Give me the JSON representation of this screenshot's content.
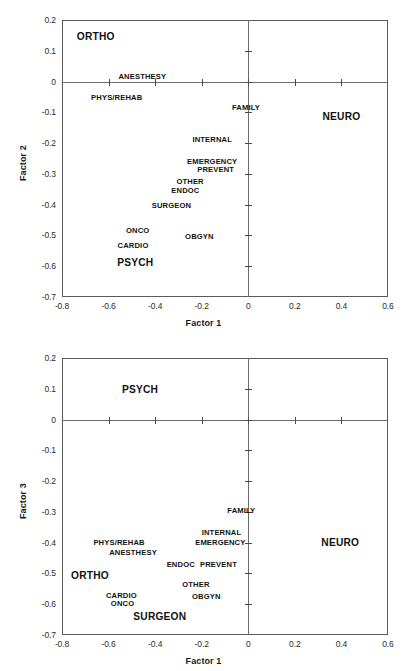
{
  "chart_data": [
    {
      "type": "scatter",
      "title": "",
      "xlabel": "Factor 1",
      "ylabel": "Factor 2",
      "xlim": [
        -0.8,
        0.6
      ],
      "ylim": [
        -0.7,
        0.2
      ],
      "xticks": [
        -0.8,
        -0.6,
        -0.4,
        -0.2,
        0,
        0.2,
        0.4,
        0.6
      ],
      "xticklabels": [
        "-0.8",
        "-0.6",
        "-0.4",
        "-0.2",
        "0",
        "0.2",
        "0.4",
        "0.6"
      ],
      "yticks": [
        0.2,
        0.1,
        0,
        -0.1,
        -0.2,
        -0.3,
        -0.4,
        -0.5,
        -0.6,
        -0.7
      ],
      "yticklabels": [
        "0.2",
        "0.1",
        "0",
        "-0.1",
        "-0.2",
        "-0.3",
        "-0.4",
        "-0.5",
        "-0.6",
        "-0.7"
      ],
      "grid": false,
      "legend": "none",
      "zero_lines": true,
      "points": [
        {
          "label": "ORTHO",
          "x": -0.655,
          "y": 0.148,
          "emphasis": "large"
        },
        {
          "label": "ANESTHESY",
          "x": -0.455,
          "y": 0.018,
          "emphasis": "normal"
        },
        {
          "label": "PHYS/REHAB",
          "x": -0.565,
          "y": -0.05,
          "emphasis": "normal"
        },
        {
          "label": "FAMILY",
          "x": -0.01,
          "y": -0.082,
          "emphasis": "normal"
        },
        {
          "label": "NEURO",
          "x": 0.4,
          "y": -0.112,
          "emphasis": "large"
        },
        {
          "label": "INTERNAL",
          "x": -0.155,
          "y": -0.188,
          "emphasis": "normal"
        },
        {
          "label": "EMERGENCY",
          "x": -0.155,
          "y": -0.258,
          "emphasis": "normal"
        },
        {
          "label": "PREVENT",
          "x": -0.14,
          "y": -0.285,
          "emphasis": "normal"
        },
        {
          "label": "OTHER",
          "x": -0.25,
          "y": -0.322,
          "emphasis": "normal"
        },
        {
          "label": "ENDOC",
          "x": -0.27,
          "y": -0.352,
          "emphasis": "normal"
        },
        {
          "label": "SURGEON",
          "x": -0.33,
          "y": -0.4,
          "emphasis": "normal"
        },
        {
          "label": "ONCO",
          "x": -0.475,
          "y": -0.482,
          "emphasis": "normal"
        },
        {
          "label": "OBGYN",
          "x": -0.21,
          "y": -0.503,
          "emphasis": "normal"
        },
        {
          "label": "CARDIO",
          "x": -0.495,
          "y": -0.53,
          "emphasis": "normal"
        },
        {
          "label": "PSYCH",
          "x": -0.485,
          "y": -0.585,
          "emphasis": "large"
        }
      ]
    },
    {
      "type": "scatter",
      "title": "",
      "xlabel": "Factor 1",
      "ylabel": "Factor 3",
      "xlim": [
        -0.8,
        0.6
      ],
      "ylim": [
        -0.7,
        0.2
      ],
      "xticks": [
        -0.8,
        -0.6,
        -0.4,
        -0.2,
        0,
        0.2,
        0.4,
        0.6
      ],
      "xticklabels": [
        "-0.8",
        "-0.6",
        "-0.4",
        "-0.2",
        "0",
        "0.2",
        "0.4",
        "0.6"
      ],
      "yticks": [
        0.2,
        0.1,
        0,
        -0.1,
        -0.2,
        -0.3,
        -0.4,
        -0.5,
        -0.6,
        -0.7
      ],
      "yticklabels": [
        "0.2",
        "0.1",
        "0",
        "-0.1",
        "-0.2",
        "-0.3",
        "-0.4",
        "-0.5",
        "-0.6",
        "-0.7"
      ],
      "grid": false,
      "legend": "none",
      "zero_lines": true,
      "points": [
        {
          "label": "PSYCH",
          "x": -0.465,
          "y": 0.098,
          "emphasis": "large"
        },
        {
          "label": "FAMILY",
          "x": -0.03,
          "y": -0.295,
          "emphasis": "normal"
        },
        {
          "label": "NEURO",
          "x": 0.395,
          "y": -0.398,
          "emphasis": "large"
        },
        {
          "label": "INTERNAL",
          "x": -0.115,
          "y": -0.365,
          "emphasis": "normal"
        },
        {
          "label": "EMERGENCY",
          "x": -0.12,
          "y": -0.398,
          "emphasis": "normal"
        },
        {
          "label": "PHYS/REHAB",
          "x": -0.555,
          "y": -0.398,
          "emphasis": "normal"
        },
        {
          "label": "ANESTHESY",
          "x": -0.495,
          "y": -0.43,
          "emphasis": "normal"
        },
        {
          "label": "ENDOC",
          "x": -0.29,
          "y": -0.468,
          "emphasis": "normal"
        },
        {
          "label": "PREVENT",
          "x": -0.128,
          "y": -0.468,
          "emphasis": "normal"
        },
        {
          "label": "ORTHO",
          "x": -0.68,
          "y": -0.505,
          "emphasis": "large"
        },
        {
          "label": "OTHER",
          "x": -0.225,
          "y": -0.535,
          "emphasis": "normal"
        },
        {
          "label": "CARDIO",
          "x": -0.545,
          "y": -0.57,
          "emphasis": "normal"
        },
        {
          "label": "OBGYN",
          "x": -0.18,
          "y": -0.572,
          "emphasis": "normal"
        },
        {
          "label": "ONCO",
          "x": -0.54,
          "y": -0.597,
          "emphasis": "normal"
        },
        {
          "label": "SURGEON",
          "x": -0.38,
          "y": -0.637,
          "emphasis": "large"
        }
      ]
    }
  ]
}
